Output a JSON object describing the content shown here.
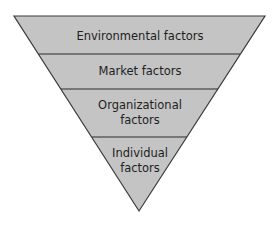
{
  "diagram": {
    "type": "inverted-pyramid",
    "fill_color": "#c4c4c4",
    "stroke_color": "#3a3a3a",
    "levels": [
      {
        "label": "Environmental factors"
      },
      {
        "label": "Market factors"
      },
      {
        "label": "Organizational factors",
        "line1": "Organizational",
        "line2": "factors"
      },
      {
        "label": "Individual factors",
        "line1": "Individual",
        "line2": "factors"
      }
    ]
  }
}
